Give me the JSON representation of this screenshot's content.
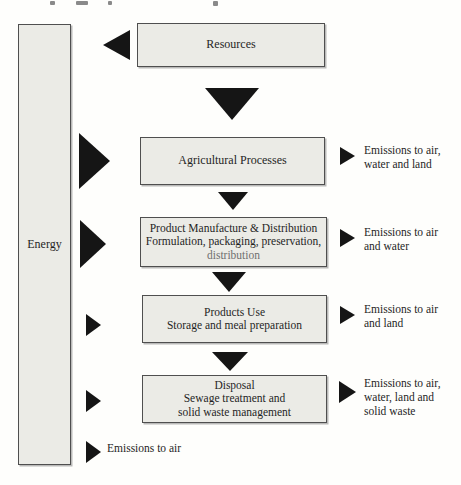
{
  "colors": {
    "paper": "#fefefc",
    "box_fill": "#ebebe6",
    "box_border": "#4f4f4f",
    "arrow": "#151515",
    "text": "#1f1f1f",
    "faded_text": "#6f6f6f"
  },
  "energy": {
    "label": "Energy"
  },
  "flow": {
    "resources": {
      "title": "Resources"
    },
    "agricultural": {
      "title": "Agricultural Processes"
    },
    "manufacture": {
      "title": "Product Manufacture & Distribution",
      "line2": "Formulation, packaging, preservation,",
      "line3": "distribution"
    },
    "use": {
      "title": "Products Use",
      "line2": "Storage and meal preparation"
    },
    "disposal": {
      "title": "Disposal",
      "line2": "Sewage treatment and",
      "line3": "solid waste management"
    }
  },
  "emissions_right": [
    {
      "text": "Emissions to air,\nwater and land"
    },
    {
      "text": "Emissions to air\nand water"
    },
    {
      "text": "Emissions to air\nand land"
    },
    {
      "text": "Emissions to air,\nwater, land and\nsolid waste"
    }
  ],
  "emissions_bottom": {
    "text": "Emissions to air"
  }
}
